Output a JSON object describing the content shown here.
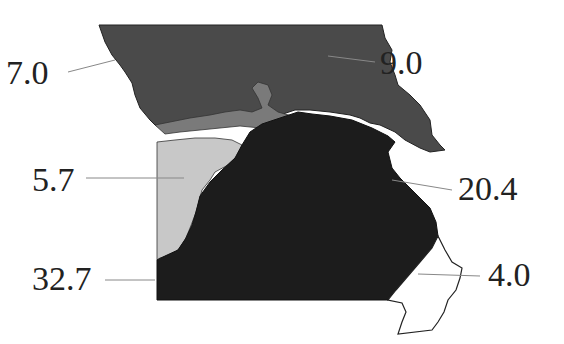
{
  "map": {
    "subject": "Missouri",
    "region_count": 6,
    "colors": {
      "north": "#4a4a4a",
      "river_band": "#7a7a7a",
      "west_light": "#c8c8c8",
      "south_dark": "#1c1c1c",
      "bootheel": "#ffffff",
      "outline": "#222222",
      "leader": "#888888"
    },
    "labels": [
      {
        "id": "nw",
        "value": "7.0"
      },
      {
        "id": "ne",
        "value": "9.0"
      },
      {
        "id": "west",
        "value": "5.7"
      },
      {
        "id": "east",
        "value": "20.4"
      },
      {
        "id": "southwest",
        "value": "32.7"
      },
      {
        "id": "bootheel",
        "value": "4.0"
      }
    ]
  }
}
